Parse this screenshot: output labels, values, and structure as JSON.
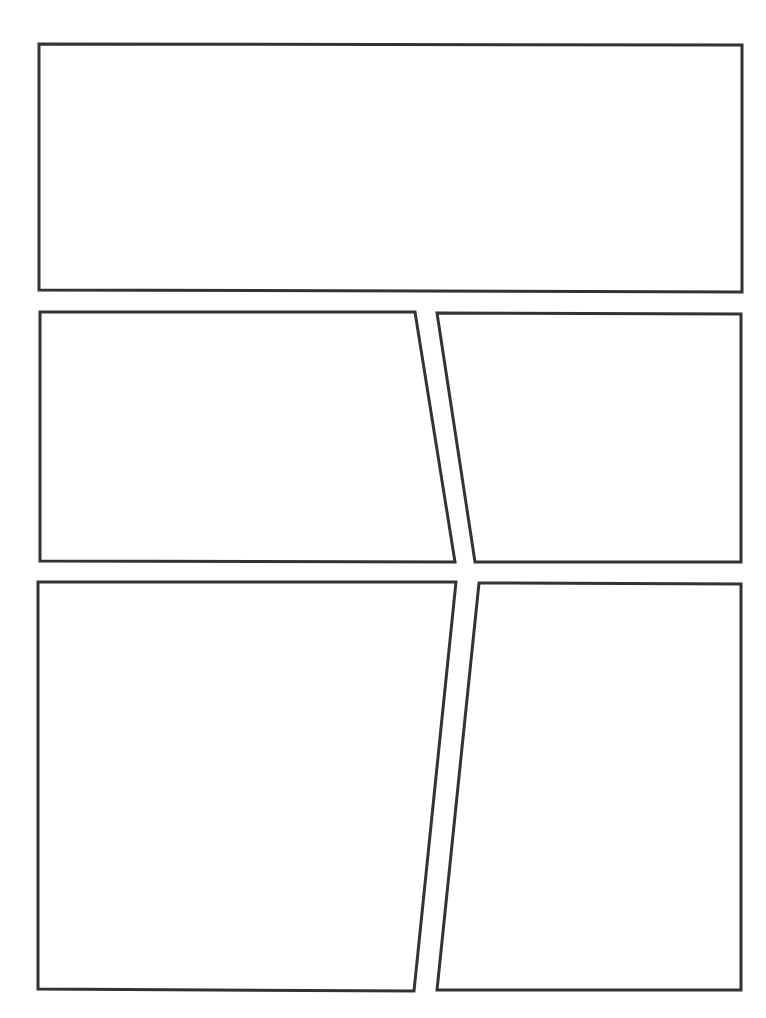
{
  "page": {
    "type": "comic-panel-template",
    "width": 766,
    "height": 1018,
    "background": "#ffffff",
    "stroke_color": "#333333",
    "stroke_width": 3
  },
  "panels": [
    {
      "id": "panel-1",
      "points": "39,44 742,45 742,292 39,290"
    },
    {
      "id": "panel-2",
      "points": "40,312 415,312 455,562 40,561"
    },
    {
      "id": "panel-3",
      "points": "437,313 741,314 741,562 475,562"
    },
    {
      "id": "panel-4",
      "points": "38,582 456,582 414,991 38,989"
    },
    {
      "id": "panel-5",
      "points": "479,583 741,584 741,990 437,990"
    }
  ]
}
